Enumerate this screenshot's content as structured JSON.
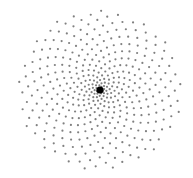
{
  "figure": {
    "background": "#ffffff",
    "center": {
      "x": 100,
      "y": 90,
      "radius": 3.6,
      "color": "#000000"
    },
    "dots": {
      "count": 420,
      "max_radius": 82,
      "color": "#555555",
      "size": 1.1,
      "opacity": 0.75,
      "golden_angle_deg": 137.508,
      "distribution_power": 0.85
    }
  }
}
